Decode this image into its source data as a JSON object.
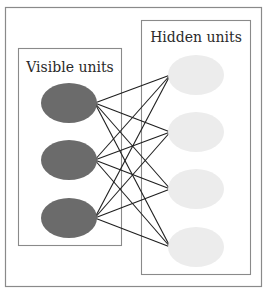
{
  "diagram": {
    "type": "bipartite-network",
    "groups": {
      "visible": {
        "label": "Visible units",
        "node_color": "#6b6b6b",
        "nodes": [
          {
            "id": "v1",
            "cx": 69,
            "cy": 103
          },
          {
            "id": "v2",
            "cx": 69,
            "cy": 160
          },
          {
            "id": "v3",
            "cx": 69,
            "cy": 218
          }
        ]
      },
      "hidden": {
        "label": "Hidden units",
        "node_color": "#ececec",
        "nodes": [
          {
            "id": "h1",
            "cx": 196,
            "cy": 75
          },
          {
            "id": "h2",
            "cx": 196,
            "cy": 132
          },
          {
            "id": "h3",
            "cx": 196,
            "cy": 189
          },
          {
            "id": "h4",
            "cx": 196,
            "cy": 247
          }
        ]
      }
    },
    "connectivity": "fully-connected",
    "colors": {
      "frame": "#8a8a8a",
      "edge": "#1e1e1e",
      "background": "#ffffff"
    }
  }
}
